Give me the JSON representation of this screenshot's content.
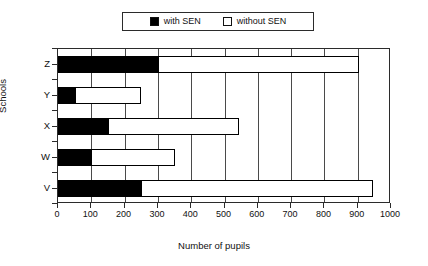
{
  "chart_data": {
    "type": "bar",
    "orientation": "horizontal",
    "stacked": true,
    "title": "",
    "xlabel": "Number of pupils",
    "ylabel": "Schools",
    "categories": [
      "V",
      "W",
      "X",
      "Y",
      "Z"
    ],
    "series": [
      {
        "name": "with SEN",
        "color": "#000000",
        "values": [
          250,
          100,
          150,
          50,
          300
        ]
      },
      {
        "name": "without SEN",
        "color": "#ffffff",
        "values": [
          695,
          250,
          395,
          200,
          605
        ]
      }
    ],
    "totals": [
      945,
      350,
      545,
      250,
      905
    ],
    "xlim": [
      0,
      1000
    ],
    "xticks": [
      0,
      100,
      200,
      300,
      400,
      500,
      600,
      700,
      800,
      900,
      1000
    ],
    "xtick_labels": [
      "0",
      "100",
      "200",
      "300",
      "400",
      "500",
      "600",
      "700",
      "800",
      "900",
      "1000"
    ],
    "grid": "vertical",
    "legend_position": "top-center",
    "legend": [
      {
        "label": "with SEN",
        "swatch": "filled-black-square"
      },
      {
        "label": "without SEN",
        "swatch": "hollow-white-square"
      }
    ]
  },
  "legend": {
    "items": [
      {
        "label": "with SEN"
      },
      {
        "label": "without SEN"
      }
    ]
  },
  "axes": {
    "x_title": "Number of pupils",
    "y_title": "Schools",
    "x_ticks": [
      "0",
      "100",
      "200",
      "300",
      "400",
      "500",
      "600",
      "700",
      "800",
      "900",
      "1000"
    ],
    "y_ticks": [
      "Z",
      "Y",
      "X",
      "W",
      "V"
    ]
  }
}
